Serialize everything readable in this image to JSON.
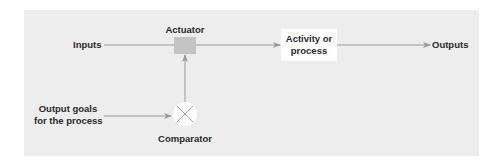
{
  "diagram": {
    "type": "control-loop",
    "background_color": "#ededed",
    "nodes": {
      "inputs": {
        "label": "Inputs"
      },
      "actuator": {
        "label": "Actuator",
        "color": "#c4c4c4"
      },
      "activity": {
        "label_line1": "Activity or",
        "label_line2": "process",
        "color": "#ffffff"
      },
      "outputs": {
        "label": "Outputs"
      },
      "output_goals": {
        "label_line1": "Output goals",
        "label_line2": "for the process"
      },
      "comparator": {
        "label": "Comparator",
        "symbol": "x-circle-icon"
      }
    },
    "edges": [
      {
        "from": "inputs",
        "to": "actuator"
      },
      {
        "from": "actuator",
        "to": "activity"
      },
      {
        "from": "activity",
        "to": "outputs"
      },
      {
        "from": "output_goals",
        "to": "comparator"
      },
      {
        "from": "comparator",
        "to": "actuator"
      }
    ],
    "line_color": "#9a9a9a"
  }
}
